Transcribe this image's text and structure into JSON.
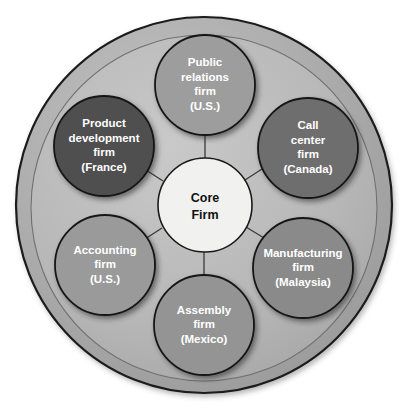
{
  "diagram": {
    "type": "hub-and-spoke-network",
    "background_color": "#ffffff",
    "outer_disc": {
      "name": "outer-boundary-disc",
      "fill": "#a8a8a8",
      "stroke": "#1a1a1a",
      "cx": 204,
      "cy": 205,
      "r": 188
    },
    "inner_disc": {
      "name": "inner-boundary-disc",
      "fill": "#b9b9b9",
      "stroke": "#6e6e6e",
      "cx": 204,
      "cy": 208,
      "r": 173
    },
    "core": {
      "label_line_1": "Core",
      "label_line_2": "Firm",
      "fill": "#f1f1ef",
      "stroke": "#1a1a1a",
      "text_color": "#111111",
      "cx": 205,
      "cy": 205,
      "r": 47
    },
    "connector_color": "#3a3a3a",
    "satellites": [
      {
        "id": "public-relations-firm",
        "lines": [
          "Public",
          "relations",
          "firm",
          "(U.S.)"
        ],
        "country": "U.S.",
        "fill": "#9d9d9d",
        "stroke": "#161616",
        "text_color": "#ffffff",
        "cx": 205,
        "cy": 85,
        "r": 50
      },
      {
        "id": "call-center-firm",
        "lines": [
          "Call",
          "center",
          "firm",
          "(Canada)"
        ],
        "country": "Canada",
        "fill": "#6e6e6e",
        "stroke": "#161616",
        "text_color": "#ffffff",
        "cx": 308,
        "cy": 148,
        "r": 50
      },
      {
        "id": "manufacturing-firm",
        "lines": [
          "Manufacturing",
          "firm",
          "(Malaysia)"
        ],
        "country": "Malaysia",
        "fill": "#8a8a8a",
        "stroke": "#161616",
        "text_color": "#ffffff",
        "cx": 303,
        "cy": 268,
        "r": 50
      },
      {
        "id": "assembly-firm",
        "lines": [
          "Assembly",
          "firm",
          "(Mexico)"
        ],
        "country": "Mexico",
        "fill": "#949494",
        "stroke": "#161616",
        "text_color": "#ffffff",
        "cx": 204,
        "cy": 325,
        "r": 50
      },
      {
        "id": "accounting-firm",
        "lines": [
          "Accounting",
          "firm",
          "(U.S.)"
        ],
        "country": "U.S.",
        "fill": "#9a9a9a",
        "stroke": "#161616",
        "text_color": "#ffffff",
        "cx": 105,
        "cy": 265,
        "r": 50
      },
      {
        "id": "product-development-firm",
        "lines": [
          "Product",
          "development",
          "firm",
          "(France)"
        ],
        "country": "France",
        "fill": "#505050",
        "stroke": "#161616",
        "text_color": "#ffffff",
        "cx": 104,
        "cy": 146,
        "r": 50
      }
    ]
  }
}
